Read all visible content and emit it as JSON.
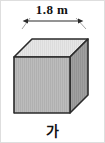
{
  "figure": {
    "shape_name": "cube",
    "caption": "가",
    "dimension_label": "1.8 m",
    "dimension_value": 1.8,
    "dimension_unit": "m",
    "edge_label_position": "top-front-edge",
    "colors": {
      "top_face": "#e3e3e3",
      "front_face": "#b5b5b5",
      "right_face": "#9a9a9a",
      "edge_stroke": "#2b2b2b",
      "hidden_edge_stroke": "#3a3a3a",
      "background": "#ffffff",
      "border": "#d8d8d8",
      "text": "#111111"
    },
    "visible_faces": [
      "top",
      "front",
      "right"
    ],
    "hidden_edges": 3
  }
}
